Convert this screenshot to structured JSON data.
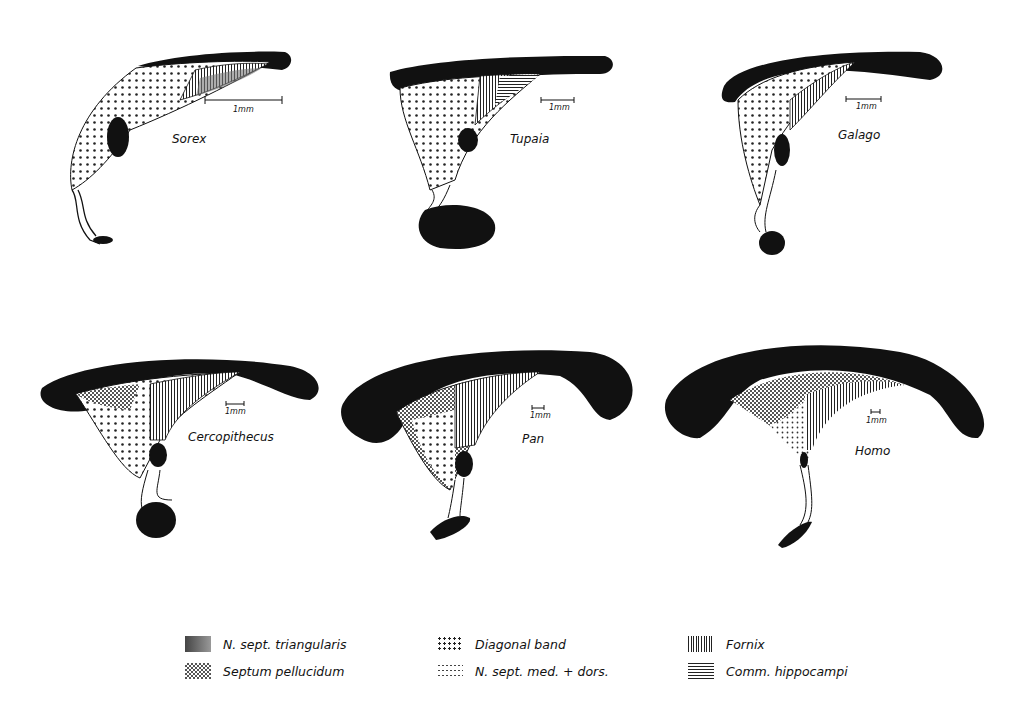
{
  "figure": {
    "panels": [
      {
        "id": "sorex",
        "label": "Sorex",
        "scale": "1mm"
      },
      {
        "id": "tupaia",
        "label": "Tupaia",
        "scale": "1mm"
      },
      {
        "id": "galago",
        "label": "Galago",
        "scale": "1mm"
      },
      {
        "id": "cercopithecus",
        "label": "Cercopithecus",
        "scale": "1mm"
      },
      {
        "id": "pan",
        "label": "Pan",
        "scale": "1mm"
      },
      {
        "id": "homo",
        "label": "Homo",
        "scale": "1mm"
      }
    ]
  },
  "legend": {
    "items": [
      {
        "label": "N. sept. triangularis",
        "pattern": "gradient-gray"
      },
      {
        "label": "Septum pellucidum",
        "pattern": "checker"
      },
      {
        "label": "Diagonal band",
        "pattern": "coarse-dots"
      },
      {
        "label": "N. sept. med. + dors.",
        "pattern": "fine-dots"
      },
      {
        "label": "Fornix",
        "pattern": "vertical-lines"
      },
      {
        "label": "Comm. hippocampi",
        "pattern": "horizontal-lines"
      }
    ]
  },
  "colors": {
    "ink": "#111111",
    "background": "#ffffff"
  }
}
